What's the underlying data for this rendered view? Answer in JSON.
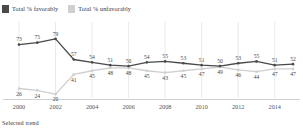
{
  "legend": {
    "items": [
      {
        "label": "Total % favorably",
        "color": "#4a4a4a",
        "icon": "legend-swatch-icon"
      },
      {
        "label": "Total % unfavorably",
        "color": "#cfcfcf",
        "icon": "legend-swatch-icon"
      }
    ]
  },
  "footer": {
    "caption": "Selected trend"
  },
  "chart_data": {
    "type": "line",
    "title": "",
    "subtitle": "",
    "xlabel": "",
    "ylabel": "",
    "grid": true,
    "legend_position": "top-left",
    "ylim": [
      0,
      100
    ],
    "x": [
      2000,
      2001,
      2002,
      2003,
      2004,
      2005,
      2006,
      2007,
      2008,
      2009,
      2010,
      2011,
      2012,
      2013,
      2014,
      2015
    ],
    "xtick_labels": [
      "2000",
      "2002",
      "2004",
      "2006",
      "2008",
      "2010",
      "2012",
      "2014"
    ],
    "xticks": [
      2000,
      2002,
      2004,
      2006,
      2008,
      2010,
      2012,
      2014
    ],
    "series": [
      {
        "name": "Total % favorably",
        "color": "#4a4a4a",
        "values": [
          73,
          75,
          79,
          57,
          54,
          51,
          50,
          54,
          55,
          53,
          51,
          50,
          53,
          55,
          51,
          52
        ]
      },
      {
        "name": "Total % unfavorably",
        "color": "#cfcfcf",
        "values": [
          26,
          24,
          20,
          41,
          45,
          48,
          48,
          45,
          43,
          45,
          47,
          49,
          46,
          44,
          47,
          47
        ]
      }
    ]
  }
}
